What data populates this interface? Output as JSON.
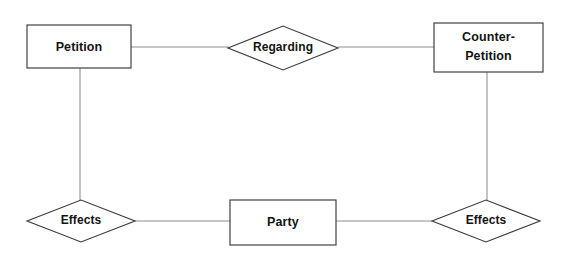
{
  "diagram": {
    "kind": "entity-relationship-diagram",
    "width": 563,
    "height": 257,
    "background_color": "#ffffff",
    "line_color": "#8d8d8d",
    "shape_stroke_color": "#3a3a3a",
    "text_color": "#141414",
    "entities": [
      {
        "id": "petition",
        "label": "Petition",
        "shape": "rectangle",
        "x": 27,
        "y": 25,
        "width": 104,
        "height": 43
      },
      {
        "id": "counter-petition",
        "label": "Counter-",
        "label_line2": "Petition",
        "shape": "rectangle",
        "x": 434,
        "y": 23,
        "width": 109,
        "height": 49
      },
      {
        "id": "party",
        "label": "Party",
        "shape": "rectangle",
        "x": 230,
        "y": 200,
        "width": 106,
        "height": 45
      }
    ],
    "relationships": [
      {
        "id": "regarding",
        "label": "Regarding",
        "shape": "diamond",
        "cx": 283,
        "cy": 48,
        "rx": 55,
        "ry": 22
      },
      {
        "id": "effects-left",
        "label": "Effects",
        "shape": "diamond",
        "cx": 81,
        "cy": 221,
        "rx": 54,
        "ry": 21
      },
      {
        "id": "effects-right",
        "label": "Effects",
        "shape": "diamond",
        "cx": 486,
        "cy": 221,
        "rx": 54,
        "ry": 21
      }
    ],
    "connections": [
      {
        "id": "petition-to-regarding",
        "from": "petition",
        "to": "regarding"
      },
      {
        "id": "regarding-to-counter-petition",
        "from": "regarding",
        "to": "counter-petition"
      },
      {
        "id": "petition-to-effects-left",
        "from": "petition",
        "to": "effects-left"
      },
      {
        "id": "effects-left-to-party",
        "from": "effects-left",
        "to": "party"
      },
      {
        "id": "party-to-effects-right",
        "from": "party",
        "to": "effects-right"
      },
      {
        "id": "effects-right-to-counter-petition",
        "from": "effects-right",
        "to": "counter-petition"
      }
    ]
  }
}
